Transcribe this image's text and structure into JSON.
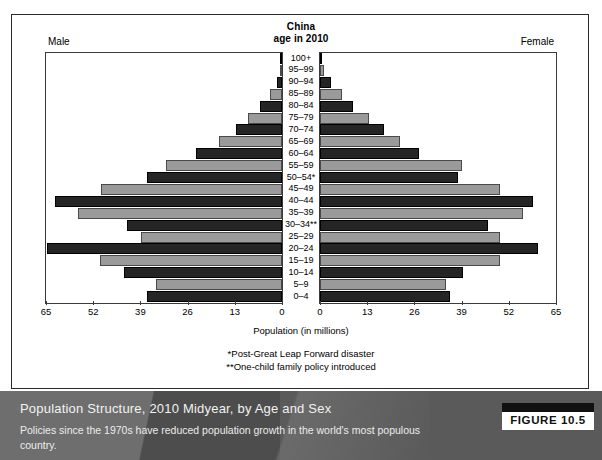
{
  "figure": {
    "header_title_line1": "China",
    "header_title_line2": "age in 2010",
    "male_label": "Male",
    "female_label": "Female",
    "x_axis_label": "Population (in millions)",
    "note_1": "*Post-Great Leap Forward disaster",
    "note_2": "**One-child family policy introduced"
  },
  "caption": {
    "title": "Population Structure, 2010 Midyear, by Age and Sex",
    "subtitle": "Policies since the 1970s have reduced population growth in the world's most populous country.",
    "figure_number": "FIGURE 10.5"
  },
  "colors": {
    "bar_dark": "#252525",
    "bar_light": "#9a9a9a",
    "caption_bar": "#5a5a5a",
    "frame": "#2b2b2b"
  },
  "chart_data": {
    "type": "bar",
    "subtype": "population-pyramid",
    "title": "China age in 2010",
    "xlabel": "Population (in millions)",
    "ylabel": "",
    "xlim": [
      0,
      65
    ],
    "xticks": [
      0,
      13,
      26,
      39,
      52,
      65
    ],
    "xticks_left_to_right_male": [
      65,
      52,
      39,
      26,
      13,
      0
    ],
    "xticks_left_to_right_female": [
      0,
      13,
      26,
      39,
      52,
      65
    ],
    "grid": false,
    "legend": "none",
    "categories": [
      "100+",
      "95–99",
      "90–94",
      "85–89",
      "80–84",
      "75–79",
      "70–74",
      "65–69",
      "60–64",
      "55–59",
      "50–54*",
      "45–49",
      "40–44",
      "35–39",
      "30–34**",
      "25–29",
      "20–24",
      "15–19",
      "10–14",
      "5–9",
      "0–4"
    ],
    "series": [
      {
        "name": "Male",
        "side": "left",
        "values": [
          0.05,
          0.4,
          1.3,
          3.2,
          6.1,
          9.3,
          12.8,
          17.4,
          23.8,
          31.9,
          37.3,
          49.9,
          62.6,
          56.3,
          42.8,
          38.8,
          64.8,
          50.2,
          43.5,
          34.7,
          37.3
        ]
      },
      {
        "name": "Female",
        "side": "right",
        "values": [
          0.3,
          1.2,
          3.0,
          6.1,
          9.2,
          13.6,
          17.6,
          22.1,
          27.4,
          39.0,
          38.0,
          49.7,
          58.6,
          55.8,
          46.4,
          49.7,
          60.1,
          49.6,
          39.4,
          34.7,
          35.8
        ]
      }
    ]
  }
}
